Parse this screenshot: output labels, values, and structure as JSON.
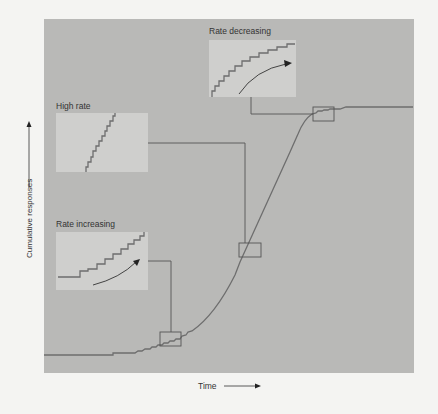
{
  "figure": {
    "type": "cumulative-record-diagram",
    "axes": {
      "x_label": "Time",
      "y_label": "Cumulative responses",
      "x_arrow_icon": "arrow-right-icon",
      "y_arrow_icon": "arrow-up-icon"
    },
    "insets": [
      {
        "id": "rate-increasing",
        "label": "Rate increasing",
        "description": "step pattern with gradually increasing step frequency, curved arrow indicating acceleration"
      },
      {
        "id": "high-rate",
        "label": "High rate",
        "description": "steep, regular staircase of small steps"
      },
      {
        "id": "rate-decreasing",
        "label": "Rate decreasing",
        "description": "step pattern flattening out, curved arrow indicating deceleration"
      }
    ],
    "colors": {
      "page_background": "#f4f4f2",
      "panel_background": "#b9b9b7",
      "inset_background": "#cfcfcd",
      "curve": "#6e6e6e",
      "connector": "#555555",
      "text": "#333333"
    }
  }
}
